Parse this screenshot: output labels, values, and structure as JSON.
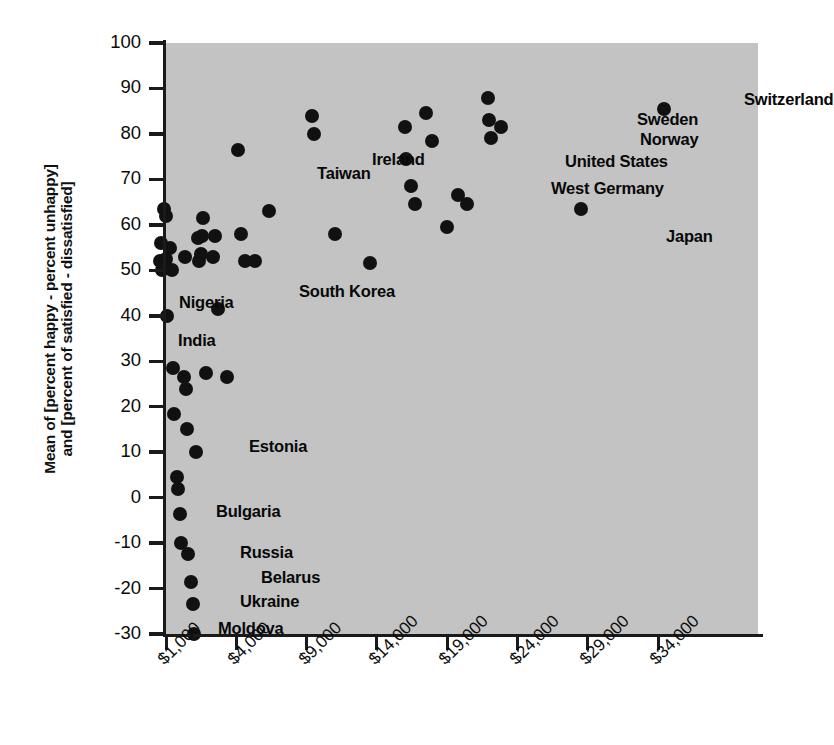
{
  "chart_data": {
    "type": "scatter",
    "title": "",
    "xlabel": "",
    "ylabel_line1": "Mean of [percent happy - percent unhappy]",
    "ylabel_line2": "and [percent of satisfied - dissatisfied]",
    "xtick_labels": [
      "$1,000",
      "$4,000",
      "$9,000",
      "$14,000",
      "$19,000",
      "$24,000",
      "$29,000",
      "$34,000"
    ],
    "xtick_values": [
      1000,
      4000,
      9000,
      14000,
      19000,
      24000,
      29000,
      34000
    ],
    "ytick_labels": [
      "100",
      "90",
      "80",
      "70",
      "60",
      "50",
      "40",
      "30",
      "20",
      "10",
      "0",
      "-10",
      "-20",
      "-30"
    ],
    "ytick_values": [
      100,
      90,
      80,
      70,
      60,
      50,
      40,
      30,
      20,
      10,
      0,
      -10,
      -20,
      -30
    ],
    "xlim": [
      -1000,
      36000
    ],
    "ylim": [
      -30,
      100
    ],
    "grid": false,
    "legend": "none",
    "marker_color": "#111111",
    "plot_background": "#c3c3c3",
    "page_background": "#ffffff",
    "points": [
      {
        "x": 750,
        "y": 52,
        "label": ""
      },
      {
        "x": 800,
        "y": 56,
        "label": ""
      },
      {
        "x": 820,
        "y": 50,
        "label": ""
      },
      {
        "x": 900,
        "y": 63.5,
        "label": ""
      },
      {
        "x": 980,
        "y": 62,
        "label": ""
      },
      {
        "x": 1000,
        "y": 52.5,
        "label": ""
      },
      {
        "x": 1050,
        "y": 40,
        "label": "India"
      },
      {
        "x": 1150,
        "y": 55,
        "label": "Nigeria"
      },
      {
        "x": 1250,
        "y": 50,
        "label": ""
      },
      {
        "x": 1300,
        "y": 28.5,
        "label": ""
      },
      {
        "x": 1350,
        "y": 18.5,
        "label": ""
      },
      {
        "x": 1450,
        "y": 4.5,
        "label": ""
      },
      {
        "x": 1500,
        "y": 2,
        "label": ""
      },
      {
        "x": 1600,
        "y": -3.5,
        "label": "Bulgaria"
      },
      {
        "x": 1620,
        "y": -10,
        "label": ""
      },
      {
        "x": 1750,
        "y": 26.5,
        "label": ""
      },
      {
        "x": 1800,
        "y": 53,
        "label": ""
      },
      {
        "x": 1850,
        "y": 24,
        "label": ""
      },
      {
        "x": 1900,
        "y": 15,
        "label": ""
      },
      {
        "x": 1950,
        "y": -12.5,
        "label": "Russia"
      },
      {
        "x": 2050,
        "y": -18.5,
        "label": "Belarus"
      },
      {
        "x": 2150,
        "y": -23.5,
        "label": "Ukraine"
      },
      {
        "x": 2200,
        "y": -30,
        "label": "Moldova"
      },
      {
        "x": 2300,
        "y": 10,
        "label": "Estonia"
      },
      {
        "x": 2350,
        "y": 57,
        "label": ""
      },
      {
        "x": 2400,
        "y": 52,
        "label": ""
      },
      {
        "x": 2500,
        "y": 53.5,
        "label": ""
      },
      {
        "x": 2550,
        "y": 57.5,
        "label": ""
      },
      {
        "x": 2600,
        "y": 61.5,
        "label": ""
      },
      {
        "x": 2700,
        "y": 27.5,
        "label": ""
      },
      {
        "x": 3000,
        "y": 53,
        "label": ""
      },
      {
        "x": 3100,
        "y": 57.5,
        "label": ""
      },
      {
        "x": 3200,
        "y": 41.5,
        "label": ""
      },
      {
        "x": 3600,
        "y": 26.5,
        "label": ""
      },
      {
        "x": 4100,
        "y": 76.5,
        "label": ""
      },
      {
        "x": 4300,
        "y": 58,
        "label": ""
      },
      {
        "x": 4600,
        "y": 52,
        "label": "South Korea"
      },
      {
        "x": 5300,
        "y": 52,
        "label": ""
      },
      {
        "x": 6300,
        "y": 63,
        "label": "Taiwan"
      },
      {
        "x": 9400,
        "y": 84,
        "label": ""
      },
      {
        "x": 9500,
        "y": 80,
        "label": "Ireland"
      },
      {
        "x": 11000,
        "y": 58,
        "label": ""
      },
      {
        "x": 13500,
        "y": 51.5,
        "label": ""
      },
      {
        "x": 16000,
        "y": 81.5,
        "label": ""
      },
      {
        "x": 16100,
        "y": 74.5,
        "label": ""
      },
      {
        "x": 16400,
        "y": 68.5,
        "label": ""
      },
      {
        "x": 16700,
        "y": 64.5,
        "label": ""
      },
      {
        "x": 17500,
        "y": 84.5,
        "label": ""
      },
      {
        "x": 17900,
        "y": 78.5,
        "label": ""
      },
      {
        "x": 19000,
        "y": 59.5,
        "label": ""
      },
      {
        "x": 19800,
        "y": 66.5,
        "label": "West Germany"
      },
      {
        "x": 20400,
        "y": 64.5,
        "label": ""
      },
      {
        "x": 21900,
        "y": 88,
        "label": ""
      },
      {
        "x": 22000,
        "y": 83,
        "label": "Sweden"
      },
      {
        "x": 22100,
        "y": 79,
        "label": "United States"
      },
      {
        "x": 22800,
        "y": 81.5,
        "label": "Norway"
      },
      {
        "x": 28500,
        "y": 63.5,
        "label": "Japan"
      },
      {
        "x": 34400,
        "y": 85.5,
        "label": "Switzerland"
      }
    ],
    "annotations": [
      {
        "text": "Switzerland",
        "x": 744,
        "y": 90
      },
      {
        "text": "Sweden",
        "x": 637,
        "y": 110
      },
      {
        "text": "Norway",
        "x": 640,
        "y": 130
      },
      {
        "text": "United States",
        "x": 565,
        "y": 152
      },
      {
        "text": "West Germany",
        "x": 551,
        "y": 179
      },
      {
        "text": "Japan",
        "x": 666,
        "y": 227
      },
      {
        "text": "Ireland",
        "x": 372,
        "y": 150
      },
      {
        "text": "Taiwan",
        "x": 317,
        "y": 164
      },
      {
        "text": "South Korea",
        "x": 299,
        "y": 282
      },
      {
        "text": "Nigeria",
        "x": 179,
        "y": 293
      },
      {
        "text": "India",
        "x": 178,
        "y": 331
      },
      {
        "text": "Estonia",
        "x": 249,
        "y": 437
      },
      {
        "text": "Bulgaria",
        "x": 216,
        "y": 502
      },
      {
        "text": "Russia",
        "x": 240,
        "y": 543
      },
      {
        "text": "Belarus",
        "x": 261,
        "y": 568
      },
      {
        "text": "Ukraine",
        "x": 240,
        "y": 592
      },
      {
        "text": "Moldova",
        "x": 218,
        "y": 619
      }
    ]
  }
}
